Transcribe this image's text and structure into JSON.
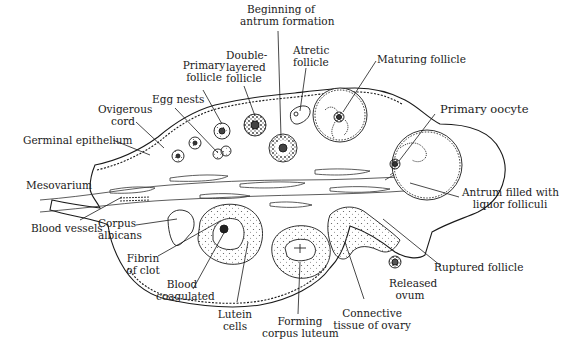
{
  "diagram": {
    "labels": {
      "beginning_antrum": [
        "Beginning of",
        "antrum formation"
      ],
      "atretic_follicle": [
        "Atretic",
        "follicle"
      ],
      "maturing_follicle": [
        "Maturing follicle"
      ],
      "primary_follicle": [
        "Primary",
        "follicle"
      ],
      "double_layered_follicle": [
        "Double-",
        "layered",
        "follicle"
      ],
      "egg_nests": [
        "Egg nests"
      ],
      "ovigerous_cord": [
        "Ovigerous",
        "cord"
      ],
      "germinal_epithelium": [
        "Germinal epithelium"
      ],
      "primary_oocyte": [
        "Primary oocyte"
      ],
      "mesovarium": [
        "Mesovarium"
      ],
      "antrum_filled": [
        "Antrum filled with",
        "liquor folliculi"
      ],
      "blood_vessels": [
        "Blood vessels"
      ],
      "corpus_albicans": [
        "Corpus",
        "albicans"
      ],
      "fibrin_of_clot": [
        "Fibrin",
        "of clot"
      ],
      "ruptured_follicle": [
        "Ruptured follicle"
      ],
      "released_ovum": [
        "Released",
        "ovum"
      ],
      "blood_coagulated": [
        "Blood",
        "coagulated"
      ],
      "lutein_cells": [
        "Lutein",
        "cells"
      ],
      "forming_corpus_luteum": [
        "Forming",
        "corpus luteum"
      ],
      "connective_tissue": [
        "Connective",
        "tissue of ovary"
      ]
    },
    "colors": {
      "ink": "#1a1a1a",
      "background": "#ffffff"
    }
  }
}
